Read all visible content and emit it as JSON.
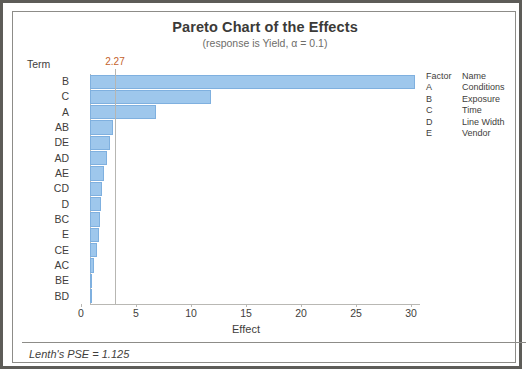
{
  "chart_data": {
    "type": "bar",
    "orientation": "horizontal",
    "title": "Pareto Chart of the Effects",
    "subtitle": "(response is Yield, α = 0.1)",
    "xlabel": "Effect",
    "ylabel": "Term",
    "categories": [
      "B",
      "C",
      "A",
      "AB",
      "DE",
      "AD",
      "AE",
      "CD",
      "D",
      "BC",
      "E",
      "CE",
      "AC",
      "BE",
      "BD"
    ],
    "values": [
      29.5,
      11.0,
      6.0,
      2.1,
      1.8,
      1.5,
      1.3,
      1.1,
      1.0,
      0.9,
      0.8,
      0.6,
      0.4,
      0.1,
      0.05
    ],
    "xlim": [
      0,
      30
    ],
    "xticks": [
      0,
      5,
      10,
      15,
      20,
      25,
      30
    ],
    "xtick_labels": [
      "0",
      "5",
      "10",
      "15",
      "20",
      "25",
      "30"
    ],
    "grid": false,
    "legend_position": "right",
    "reference_line": {
      "value": 2.27,
      "label": "2.27",
      "color": "#c4622d"
    },
    "bar_color": "#9ec7ec",
    "bar_border_color": "#7fb0df"
  },
  "legend": {
    "header": {
      "code": "Factor",
      "name": "Name"
    },
    "rows": [
      {
        "code": "A",
        "name": "Conditions"
      },
      {
        "code": "B",
        "name": "Exposure"
      },
      {
        "code": "C",
        "name": "Time"
      },
      {
        "code": "D",
        "name": "Line Width"
      },
      {
        "code": "E",
        "name": "Vendor"
      }
    ]
  },
  "footer": {
    "note": "Lenth's PSE = 1.125"
  }
}
